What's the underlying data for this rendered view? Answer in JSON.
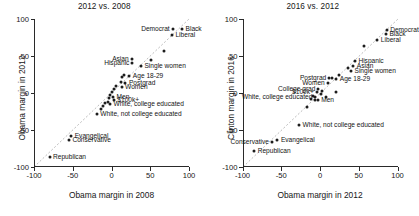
{
  "figure": {
    "background": "#ffffff",
    "point_color": "#1d1d1d",
    "refline_color": "#bcbcbc"
  },
  "chart_data": [
    {
      "type": "scatter",
      "title": "2012 vs. 2008",
      "xlabel": "Obama margin in 2008",
      "ylabel": "Obama margin in 2012",
      "xlim": [
        -100,
        100
      ],
      "ylim": [
        -100,
        100
      ],
      "xticks": [
        -100,
        -50,
        0,
        50,
        100
      ],
      "yticks": [
        -100,
        -50,
        0,
        50,
        100
      ],
      "xtick_labels": [
        "-100",
        "-50",
        "0",
        "50",
        "100"
      ],
      "ytick_labels": [
        "-100",
        "-50",
        "0",
        "50",
        "100"
      ],
      "grid": false,
      "legend": "none",
      "reference_line": "y = x (dotted diagonal)",
      "points": [
        {
          "label": "Black",
          "x": 91,
          "y": 86,
          "side": "right"
        },
        {
          "label": "Democrat",
          "x": 79,
          "y": 86,
          "side": "left"
        },
        {
          "label": "Liberal",
          "x": 78,
          "y": 78,
          "side": "right"
        },
        {
          "label": "",
          "x": 68,
          "y": 57,
          "side": "right"
        },
        {
          "label": "",
          "x": 51,
          "y": 44,
          "side": "right"
        },
        {
          "label": "Asian",
          "x": 26,
          "y": 46,
          "side": "left"
        },
        {
          "label": "Hispanic",
          "x": 27,
          "y": 41,
          "side": "left"
        },
        {
          "label": "Single women",
          "x": 38,
          "y": 36,
          "side": "right"
        },
        {
          "label": "Age 18-29",
          "x": 23,
          "y": 23,
          "side": "right"
        },
        {
          "label": "",
          "x": 16,
          "y": 24,
          "side": "right"
        },
        {
          "label": "",
          "x": 13,
          "y": 22,
          "side": "right"
        },
        {
          "label": "Postgrad",
          "x": 18,
          "y": 14,
          "side": "right"
        },
        {
          "label": "",
          "x": 12,
          "y": 15,
          "side": "right"
        },
        {
          "label": "Women",
          "x": 13,
          "y": 8,
          "side": "right"
        },
        {
          "label": "",
          "x": 6,
          "y": 10,
          "side": "right"
        },
        {
          "label": "",
          "x": 3,
          "y": 6,
          "side": "right"
        },
        {
          "label": "",
          "x": 1,
          "y": 2,
          "side": "right"
        },
        {
          "label": "Men",
          "x": 2,
          "y": -5,
          "side": "right"
        },
        {
          "label": "",
          "x": -2,
          "y": -3,
          "side": "right"
        },
        {
          "label": "$100k+",
          "x": 3,
          "y": -10,
          "side": "right"
        },
        {
          "label": "",
          "x": -3,
          "y": -7,
          "side": "right"
        },
        {
          "label": "",
          "x": -5,
          "y": -12,
          "side": "right"
        },
        {
          "label": "White, college educated",
          "x": -2,
          "y": -15,
          "side": "right"
        },
        {
          "label": "",
          "x": -9,
          "y": -13,
          "side": "right"
        },
        {
          "label": "",
          "x": -11,
          "y": -18,
          "side": "right"
        },
        {
          "label": "",
          "x": -14,
          "y": -21,
          "side": "right"
        },
        {
          "label": "White, not college educated",
          "x": -19,
          "y": -29,
          "side": "right"
        },
        {
          "label": "Evangelical",
          "x": -52,
          "y": -58,
          "side": "right"
        },
        {
          "label": "Conservative",
          "x": -55,
          "y": -63,
          "side": "right"
        },
        {
          "label": "Republican",
          "x": -80,
          "y": -87,
          "side": "right"
        }
      ]
    },
    {
      "type": "scatter",
      "title": "2016 vs. 2012",
      "xlabel": "Obama margin in 2012",
      "ylabel": "Clinton margin in 2016",
      "xlim": [
        -100,
        100
      ],
      "ylim": [
        -100,
        100
      ],
      "xticks": [
        -100,
        -50,
        0,
        50,
        100
      ],
      "yticks": [
        -100,
        -50,
        0,
        50,
        100
      ],
      "xtick_labels": [
        "-100",
        "-50",
        "0",
        "50",
        "100"
      ],
      "ytick_labels": [
        "-100",
        "-50",
        "0",
        "50",
        "100"
      ],
      "grid": false,
      "legend": "none",
      "reference_line": "y = x (dotted diagonal)",
      "points": [
        {
          "label": "Democrat",
          "x": 86,
          "y": 85,
          "side": "right"
        },
        {
          "label": "Black",
          "x": 85,
          "y": 80,
          "side": "right"
        },
        {
          "label": "Liberal",
          "x": 74,
          "y": 72,
          "side": "right"
        },
        {
          "label": "",
          "x": 57,
          "y": 63,
          "side": "right"
        },
        {
          "label": "Hispanic",
          "x": 45,
          "y": 43,
          "side": "right"
        },
        {
          "label": "Asian",
          "x": 43,
          "y": 37,
          "side": "right"
        },
        {
          "label": "Single women",
          "x": 40,
          "y": 30,
          "side": "right"
        },
        {
          "label": "",
          "x": 36,
          "y": 34,
          "side": "right"
        },
        {
          "label": "",
          "x": 24,
          "y": 25,
          "side": "right"
        },
        {
          "label": "Age 18-29",
          "x": 21,
          "y": 19,
          "side": "right"
        },
        {
          "label": "Postgrad",
          "x": 12,
          "y": 20,
          "side": "left"
        },
        {
          "label": "",
          "x": 16,
          "y": 20,
          "side": "right"
        },
        {
          "label": "Women",
          "x": 10,
          "y": 14,
          "side": "left"
        },
        {
          "label": "",
          "x": 21,
          "y": 2,
          "side": "right"
        },
        {
          "label": "College grad",
          "x": -2,
          "y": 5,
          "side": "left"
        },
        {
          "label": "$100k+",
          "x": -4,
          "y": 1,
          "side": "left"
        },
        {
          "label": "",
          "x": 3,
          "y": 3,
          "side": "right"
        },
        {
          "label": "",
          "x": 1,
          "y": -1,
          "side": "right"
        },
        {
          "label": "White, college educated",
          "x": -6,
          "y": -5,
          "side": "left"
        },
        {
          "label": "",
          "x": -9,
          "y": -4,
          "side": "right"
        },
        {
          "label": "",
          "x": 8,
          "y": -5,
          "side": "right"
        },
        {
          "label": "Men",
          "x": -3,
          "y": -10,
          "side": "right"
        },
        {
          "label": "",
          "x": -6,
          "y": -9,
          "side": "right"
        },
        {
          "label": "",
          "x": -11,
          "y": -8,
          "side": "right"
        },
        {
          "label": "",
          "x": -17,
          "y": -19,
          "side": "right"
        },
        {
          "label": "White, not college educated",
          "x": -27,
          "y": -43,
          "side": "right"
        },
        {
          "label": "Evangelical",
          "x": -55,
          "y": -64,
          "side": "right"
        },
        {
          "label": "Conservative",
          "x": -62,
          "y": -66,
          "side": "left"
        },
        {
          "label": "Republican",
          "x": -85,
          "y": -79,
          "side": "right"
        }
      ]
    }
  ]
}
